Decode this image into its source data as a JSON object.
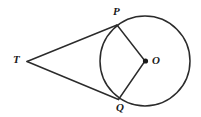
{
  "figure": {
    "background_color": "#ffffff",
    "stroke_color": "#2b2b2b",
    "label_color": "#1a1a1a",
    "width": 201,
    "height": 117
  },
  "labels": {
    "external_point": "T",
    "upper_tangent_point": "P",
    "center": "O",
    "lower_tangent_point": "Q"
  },
  "geometry": {
    "circle": {
      "cx": 145,
      "cy": 61,
      "r": 45
    },
    "center_dot": {
      "cx": 145.5,
      "cy": 61,
      "r": 2.6
    },
    "external_point": {
      "x": 27,
      "y": 61
    },
    "tangent_point_upper": {
      "x": 117,
      "y": 25
    },
    "tangent_point_lower": {
      "x": 118,
      "y": 99
    },
    "tangent_line_upper": "M 27 61.5 L 117 25",
    "tangent_line_lower": "M 27 61.5 L 118.5 99.5",
    "radius_upper": "M 145 61 L 117 25",
    "radius_lower": "M 145 61 L 118.5 99.5"
  }
}
